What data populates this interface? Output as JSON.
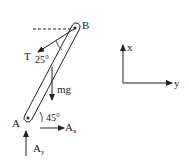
{
  "diagram": {
    "type": "free-body-diagram",
    "colors": {
      "ink": "#222222",
      "background": "#ffffff"
    },
    "points": {
      "A": {
        "label": "A"
      },
      "B": {
        "label": "B"
      }
    },
    "forces": {
      "tension": {
        "label": "T",
        "angle_label": "25°"
      },
      "weight": {
        "label": "mg"
      },
      "ax": {
        "label": "A",
        "subscript": "x"
      },
      "ay": {
        "label": "A",
        "subscript": "y"
      }
    },
    "bar_angle_label": "45°",
    "axes": {
      "x_label": "x",
      "y_label": "y"
    }
  }
}
